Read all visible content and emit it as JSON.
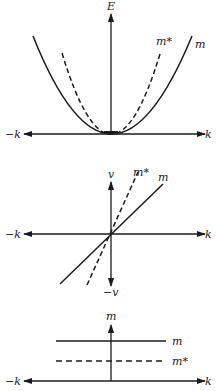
{
  "panels": [
    {
      "id": "energy",
      "y_axis_label": "E",
      "x_neg_label": "−k",
      "x_pos_label": "k",
      "curves": [
        {
          "label": "m",
          "style": "solid",
          "shape": "parabola"
        },
        {
          "label": "m*",
          "style": "dashed",
          "shape": "parabola (narrower)"
        }
      ]
    },
    {
      "id": "velocity",
      "y_axis_label": "v",
      "y_neg_label": "−v",
      "x_neg_label": "−k",
      "x_pos_label": "k",
      "curves": [
        {
          "label": "m*",
          "style": "dashed",
          "shape": "line (steeper)"
        },
        {
          "label": "m",
          "style": "solid",
          "shape": "line"
        }
      ]
    },
    {
      "id": "mass",
      "y_axis_label": "m",
      "x_neg_label": "−k",
      "x_pos_label": "k",
      "curves": [
        {
          "label": "m",
          "style": "solid",
          "shape": "horizontal line"
        },
        {
          "label": "m*",
          "style": "dashed",
          "shape": "horizontal line (lower)"
        }
      ]
    }
  ],
  "colors": {
    "ink": "#1a1a1a",
    "background": "#ffffff"
  }
}
